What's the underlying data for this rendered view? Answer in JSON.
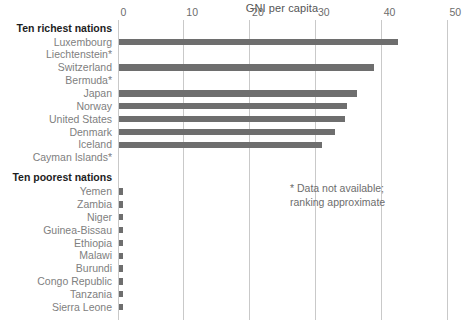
{
  "chart_data": {
    "type": "bar",
    "title": "GNI per capita",
    "xlabel": "",
    "ylabel": "",
    "xlim": [
      0,
      50
    ],
    "xticks": [
      0,
      10,
      20,
      30,
      40,
      50
    ],
    "xtick_labels": [
      "0",
      "10",
      "20",
      "30",
      "40",
      "50"
    ],
    "grid": "vertical",
    "legend": "none",
    "orientation": "horizontal",
    "bar_color": "#6e6e6e",
    "sections": [
      {
        "heading": "Ten richest nations",
        "categories": [
          "Luxembourg",
          "Liechtenstein*",
          "Switzerland",
          "Bermuda*",
          "Japan",
          "Norway",
          "United States",
          "Denmark",
          "Iceland",
          "Cayman Islands*"
        ],
        "values": [
          42.5,
          null,
          38.8,
          null,
          36.3,
          34.8,
          34.4,
          32.9,
          30.9,
          null
        ]
      },
      {
        "heading": "Ten poorest nations",
        "categories": [
          "Yemen",
          "Zambia",
          "Niger",
          "Guinea-Bissau",
          "Ethiopia",
          "Malawi",
          "Burundi",
          "Congo Republic",
          "Tanzania",
          "Sierra Leone"
        ],
        "values": [
          0.5,
          0.5,
          0.5,
          0.5,
          0.5,
          0.5,
          0.5,
          0.5,
          0.5,
          0.5
        ]
      }
    ],
    "annotations": [
      {
        "text": "* Data not available;\nranking approximate"
      }
    ]
  }
}
